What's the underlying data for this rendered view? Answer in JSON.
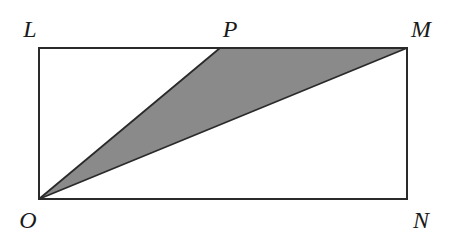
{
  "diagram": {
    "type": "geometry-figure",
    "colors": {
      "background": "#ffffff",
      "stroke": "#2a2a2a",
      "shade_fill": "#8a8a8a"
    },
    "points": {
      "L": {
        "label": "L",
        "x": 39,
        "y": 48
      },
      "P": {
        "label": "P",
        "x": 220,
        "y": 48
      },
      "M": {
        "label": "M",
        "x": 407,
        "y": 48
      },
      "N": {
        "label": "N",
        "x": 407,
        "y": 199
      },
      "O": {
        "label": "O",
        "x": 39,
        "y": 199
      }
    },
    "labels": {
      "L": {
        "text": "L",
        "x": 30,
        "y": 37
      },
      "P": {
        "text": "P",
        "x": 230,
        "y": 37
      },
      "M": {
        "text": "M",
        "x": 421,
        "y": 37
      },
      "O": {
        "text": "O",
        "x": 28,
        "y": 228
      },
      "N": {
        "text": "N",
        "x": 421,
        "y": 228
      }
    },
    "shapes": {
      "rectangle": [
        "L",
        "M",
        "N",
        "O"
      ],
      "shaded_triangle": [
        "O",
        "P",
        "M"
      ],
      "segments": [
        [
          "O",
          "P"
        ],
        [
          "O",
          "M"
        ]
      ]
    }
  }
}
